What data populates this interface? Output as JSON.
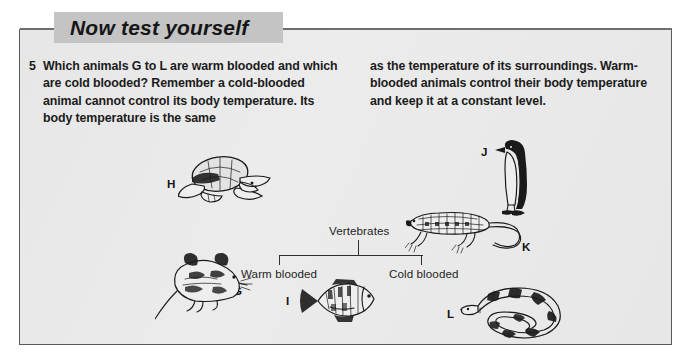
{
  "page": {
    "background_color": "#ffffff",
    "panel_background_color": "#ebebeb",
    "border_color": "#5a5a5a",
    "ink_color": "#1a1a1a"
  },
  "header": {
    "banner_title": "Now test yourself",
    "banner_background_color": "#c4c4c4",
    "rule_color": "#6e6e6e"
  },
  "question": {
    "number": "5",
    "column_left": "Which animals G to L are warm blooded and which are cold blooded? Remember a cold-blooded animal cannot control its body temperature. Its body temperature is the same",
    "column_right": "as the temperature of its surroundings. Warm-blooded animals control their body temperature and keep it at a constant level."
  },
  "diagram": {
    "root_label": "Vertebrates",
    "branch_left_label": "Warm blooded",
    "branch_right_label": "Cold blooded"
  },
  "animals": [
    {
      "letter": "G",
      "name": "mouse"
    },
    {
      "letter": "H",
      "name": "turtle"
    },
    {
      "letter": "I",
      "name": "fish"
    },
    {
      "letter": "J",
      "name": "penguin"
    },
    {
      "letter": "K",
      "name": "lizard"
    },
    {
      "letter": "L",
      "name": "snake"
    }
  ]
}
